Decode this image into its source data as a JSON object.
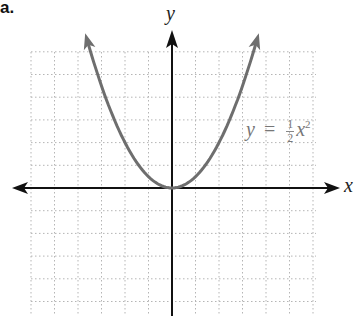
{
  "part_label": "a.",
  "axes": {
    "x_label": "x",
    "y_label": "y"
  },
  "equation": {
    "lhs": "y",
    "eq": "=",
    "num": "1",
    "den": "2",
    "var": "x",
    "exp": "2"
  },
  "chart_data": {
    "type": "line",
    "title": "",
    "function": "y = (1/2) x^2",
    "xlabel": "x",
    "ylabel": "y",
    "xlim": [
      -6,
      6
    ],
    "ylim": [
      -5.5,
      6
    ],
    "grid": true,
    "grid_style": "dotted",
    "series": [
      {
        "name": "y = 1/2 x^2",
        "x": [
          -3.6,
          -3,
          -2,
          -1,
          0,
          1,
          2,
          3,
          3.6
        ],
        "y": [
          6.48,
          4.5,
          2,
          0.5,
          0,
          0.5,
          2,
          4.5,
          6.48
        ],
        "color": "#6e6e6e",
        "arrows_at_ends": true
      }
    ],
    "annotations": [
      {
        "text": "y = 1/2 x^2",
        "x": 3.2,
        "y": 2.6
      }
    ]
  },
  "colors": {
    "axis": "#111111",
    "grid": "#b5b5b5",
    "curve": "#6e6e6e"
  }
}
